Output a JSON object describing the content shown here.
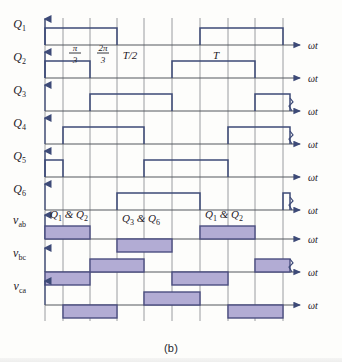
{
  "figure": {
    "caption": "(b)",
    "axis_label": "ωt",
    "colors": {
      "trace": "#3d4a77",
      "axis": "#55585f",
      "grid": "#7b7e86",
      "fill": "#b2acd4",
      "fill_border": "#4a4d80",
      "text": "#1d2026",
      "background": "#fdfdfb"
    },
    "time_markers": [
      {
        "label": "π/3",
        "numerator": "π",
        "denominator": "3",
        "x": 75
      },
      {
        "label": "2π/3",
        "numerator": "2π",
        "denominator": "3",
        "x": 103
      },
      {
        "label": "T/2",
        "x": 130
      },
      {
        "label": "T",
        "x": 216
      }
    ],
    "grid_x": [
      45,
      63,
      90,
      117,
      144,
      172,
      200,
      228,
      255,
      283
    ],
    "rows": [
      {
        "name": "Q1",
        "label": "Q",
        "sub": "1",
        "type": "gate",
        "baseline": 45,
        "high": 28,
        "pulses": [
          [
            45,
            117
          ],
          [
            200,
            283
          ]
        ],
        "break_mark": false
      },
      {
        "name": "Q2",
        "label": "Q",
        "sub": "2",
        "type": "gate",
        "baseline": 78,
        "high": 61,
        "pulses": [
          [
            45,
            90
          ],
          [
            172,
            255
          ]
        ],
        "break_mark": false
      },
      {
        "name": "Q3",
        "label": "Q",
        "sub": "3",
        "type": "gate",
        "baseline": 111,
        "high": 94,
        "pulses": [
          [
            90,
            172
          ],
          [
            255,
            290
          ]
        ],
        "break_mark": true
      },
      {
        "name": "Q4",
        "label": "Q",
        "sub": "4",
        "type": "gate",
        "baseline": 144,
        "high": 127,
        "pulses": [
          [
            63,
            144
          ],
          [
            228,
            290
          ]
        ],
        "break_mark": true
      },
      {
        "name": "Q5",
        "label": "Q",
        "sub": "5",
        "type": "gate",
        "baseline": 177,
        "high": 160,
        "pulses": [
          [
            45,
            63
          ],
          [
            144,
            228
          ]
        ],
        "break_mark": false
      },
      {
        "name": "Q6",
        "label": "Q",
        "sub": "6",
        "type": "gate",
        "baseline": 210,
        "high": 193,
        "pulses": [
          [
            117,
            200
          ],
          [
            283,
            290
          ]
        ],
        "break_mark": true
      },
      {
        "name": "vab",
        "label": "v",
        "sub": "ab",
        "type": "voltage",
        "baseline": 239,
        "amp": 13,
        "blocks": [
          {
            "from": 45,
            "to": 90,
            "sign": 1
          },
          {
            "from": 117,
            "to": 172,
            "sign": -1
          },
          {
            "from": 200,
            "to": 255,
            "sign": 1
          }
        ],
        "break_mark": false
      },
      {
        "name": "vbc",
        "label": "v",
        "sub": "bc",
        "type": "voltage",
        "baseline": 272,
        "amp": 13,
        "blocks": [
          {
            "from": 45,
            "to": 90,
            "sign": -1
          },
          {
            "from": 90,
            "to": 144,
            "sign": 1
          },
          {
            "from": 172,
            "to": 228,
            "sign": -1
          },
          {
            "from": 255,
            "to": 290,
            "sign": 1
          }
        ],
        "break_mark": true
      },
      {
        "name": "vca",
        "label": "v",
        "sub": "ca",
        "type": "voltage",
        "baseline": 305,
        "amp": 13,
        "blocks": [
          {
            "from": 63,
            "to": 117,
            "sign": -1
          },
          {
            "from": 144,
            "to": 200,
            "sign": 1
          },
          {
            "from": 228,
            "to": 283,
            "sign": -1
          }
        ],
        "break_mark": false
      }
    ],
    "annotations": [
      {
        "id": "ann-q1q2-left",
        "text": "Q₁ & Q₂",
        "parts": [
          "Q",
          "1",
          " & ",
          "Q",
          "2"
        ],
        "x": 50,
        "y": 218
      },
      {
        "id": "ann-q3q6",
        "text": "Q₃ & Q₆",
        "parts": [
          "Q",
          "3",
          " & ",
          "Q",
          "6"
        ],
        "x": 122,
        "y": 222
      },
      {
        "id": "ann-q1q2-right",
        "text": "Q₁ & Q₂",
        "parts": [
          "Q",
          "1",
          " & ",
          "Q",
          "2"
        ],
        "x": 205,
        "y": 218
      }
    ]
  }
}
